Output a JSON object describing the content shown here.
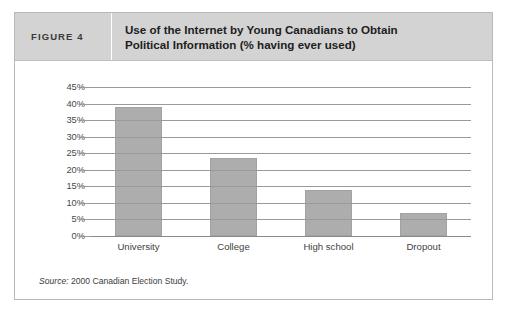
{
  "figure": {
    "number_label": "FIGURE 4",
    "title": "Use of the Internet by Young Canadians to Obtain Political Information (% having ever used)",
    "title_line1": "Use of the Internet by Young Canadians to Obtain",
    "title_line2": "Political Information (% having ever used)",
    "source_prefix": "Source:",
    "source_text": "2000 Canadian Election Study."
  },
  "colors": {
    "header_background": "#d3d3d3",
    "bar_fill": "#adadad",
    "gridline": "#9a9a9a",
    "border": "#b9b9b9",
    "text": "#1d1d1d"
  },
  "chart_data": {
    "type": "bar",
    "title": "Use of the Internet by Young Canadians to Obtain Political Information (% having ever used)",
    "xlabel": "",
    "ylabel": "",
    "categories": [
      "University",
      "College",
      "High school",
      "Dropout"
    ],
    "values": [
      39,
      23.5,
      14,
      7
    ],
    "ylim": [
      0,
      45
    ],
    "ytick_values": [
      0,
      5,
      10,
      15,
      20,
      25,
      30,
      35,
      40,
      45
    ],
    "ytick_labels": [
      "0%",
      "5%",
      "10%",
      "15%",
      "20%",
      "25%",
      "30%",
      "35%",
      "40%",
      "45%"
    ],
    "grid": true,
    "legend": false,
    "orientation": "vertical",
    "value_unit": "%"
  }
}
